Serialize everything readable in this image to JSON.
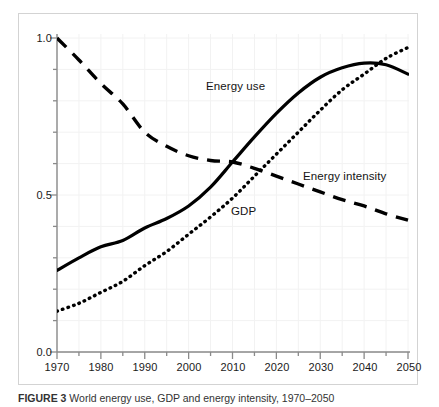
{
  "figure": {
    "caption_prefix": "FIGURE 3",
    "caption_text": "World energy use, GDP and energy intensity, 1970–2050",
    "frame_color": "#d3d3d3",
    "background_color": "#ffffff"
  },
  "axes": {
    "y_tick_labels": [
      "1.0",
      "0.5",
      "0.0"
    ],
    "x_tick_labels": [
      "1970",
      "1980",
      "1990",
      "2000",
      "2010",
      "2020",
      "2030",
      "2040",
      "2050"
    ],
    "y_axis_title": "",
    "x_axis_title": ""
  },
  "series_labels": {
    "energy_use": "Energy use",
    "energy_intensity": "Energy intensity",
    "gdp": "GDP"
  },
  "chart_data": {
    "type": "line",
    "title": "World energy use, GDP and energy intensity, 1970–2050",
    "xlabel": "",
    "ylabel": "",
    "xlim": [
      1970,
      2050
    ],
    "ylim": [
      0.0,
      1.0
    ],
    "yticks": [
      0.0,
      0.5,
      1.0
    ],
    "y_minor_tick_step": 0.1,
    "xticks": [
      1970,
      1980,
      1990,
      2000,
      2010,
      2020,
      2030,
      2040,
      2050
    ],
    "x_minor_tick_step": 5,
    "grid": "faint",
    "legend": "inline-annotations",
    "x": [
      1970,
      1975,
      1980,
      1985,
      1990,
      1995,
      2000,
      2005,
      2010,
      2015,
      2020,
      2025,
      2030,
      2035,
      2040,
      2045,
      2050
    ],
    "series": [
      {
        "name": "Energy use",
        "style": "solid",
        "color": "#000000",
        "label_position": {
          "x": 2011,
          "y": 0.845
        },
        "values": [
          0.26,
          0.3,
          0.335,
          0.355,
          0.395,
          0.425,
          0.465,
          0.525,
          0.605,
          0.685,
          0.76,
          0.825,
          0.875,
          0.905,
          0.92,
          0.915,
          0.885
        ]
      },
      {
        "name": "GDP",
        "style": "dotted",
        "color": "#000000",
        "label_position": {
          "x": 2010,
          "y": 0.435
        },
        "values": [
          0.13,
          0.155,
          0.19,
          0.225,
          0.275,
          0.32,
          0.375,
          0.43,
          0.49,
          0.56,
          0.63,
          0.7,
          0.77,
          0.835,
          0.885,
          0.935,
          0.97
        ]
      },
      {
        "name": "Energy intensity",
        "style": "dashed",
        "color": "#000000",
        "label_position": {
          "x": 2029,
          "y": 0.595
        },
        "values": [
          1.0,
          0.93,
          0.855,
          0.79,
          0.7,
          0.655,
          0.625,
          0.61,
          0.605,
          0.585,
          0.56,
          0.535,
          0.51,
          0.485,
          0.465,
          0.44,
          0.42
        ]
      }
    ]
  }
}
